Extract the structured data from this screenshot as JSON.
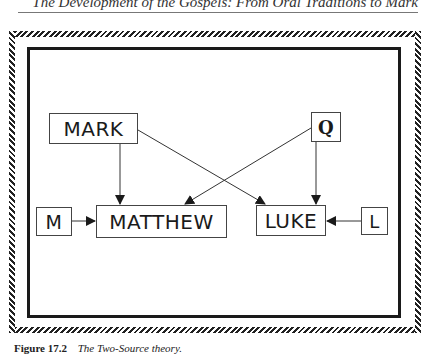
{
  "running_head": "The Development of the Gospels: From Oral Traditions to Mark",
  "diagram": {
    "nodes": [
      {
        "id": "mark",
        "label": "MARK"
      },
      {
        "id": "q",
        "label": "Q"
      },
      {
        "id": "m",
        "label": "M"
      },
      {
        "id": "matthew",
        "label": "MATTHEW"
      },
      {
        "id": "luke",
        "label": "LUKE"
      },
      {
        "id": "l",
        "label": "L"
      }
    ],
    "edges": [
      {
        "from": "MARK",
        "to": "MATTHEW"
      },
      {
        "from": "MARK",
        "to": "LUKE"
      },
      {
        "from": "Q",
        "to": "MATTHEW"
      },
      {
        "from": "Q",
        "to": "LUKE"
      },
      {
        "from": "M",
        "to": "MATTHEW"
      },
      {
        "from": "L",
        "to": "LUKE"
      }
    ]
  },
  "caption": {
    "figure_number": "Figure 17.2",
    "title": "The Two-Source theory."
  }
}
